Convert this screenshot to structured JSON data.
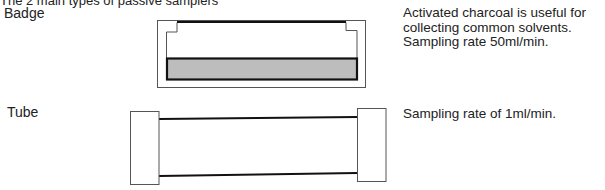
{
  "caption": "The 2 main types of passive samplers",
  "samplers": [
    {
      "name": "Badge",
      "description_lines": [
        "Activated charcoal is useful for",
        "collecting common solvents.",
        "Sampling rate 50ml/min."
      ]
    },
    {
      "name": "Tube",
      "description": "Sampling rate of 1ml/min."
    }
  ],
  "colors": {
    "line": "#111111",
    "thin_line": "#555555",
    "charcoal_fill": "#bdbdbd",
    "text": "#222222"
  }
}
